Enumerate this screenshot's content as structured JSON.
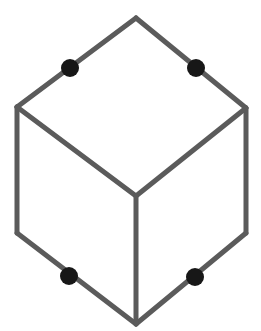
{
  "figure": {
    "type": "line-drawing",
    "canvas": {
      "width": 261,
      "height": 331,
      "background_color": "#ffffff"
    },
    "style": {
      "edge_color": "#5b5b5b",
      "edge_width": 5,
      "dot_color": "#171717",
      "dot_radius": 9
    },
    "vertices": {
      "top": {
        "label": "top-apex",
        "x": 136,
        "y": 18
      },
      "upper_left": {
        "label": "upper-left-corner",
        "x": 17,
        "y": 107
      },
      "upper_right": {
        "label": "upper-right-corner",
        "x": 246,
        "y": 108
      },
      "lower_left": {
        "label": "lower-left-corner",
        "x": 17,
        "y": 233
      },
      "lower_right": {
        "label": "lower-right-corner",
        "x": 246,
        "y": 233
      },
      "bottom": {
        "label": "bottom-apex",
        "x": 136,
        "y": 324
      },
      "center": {
        "label": "center-junction",
        "x": 136,
        "y": 196
      }
    },
    "edges": [
      {
        "name": "top-left-outer-edge",
        "from": "upper_left",
        "to": "top",
        "path": "M 17 107 L 136 18"
      },
      {
        "name": "top-right-outer-edge",
        "from": "top",
        "to": "upper_right",
        "path": "M 136 18 L 246 108"
      },
      {
        "name": "left-vertical-edge",
        "from": "upper_left",
        "to": "lower_left",
        "path": "M 17 107 L 17 233"
      },
      {
        "name": "right-vertical-edge",
        "from": "upper_right",
        "to": "lower_right",
        "path": "M 246 108 L 246 233"
      },
      {
        "name": "bottom-left-outer-edge",
        "from": "lower_left",
        "to": "bottom",
        "path": "M 17 233 L 136 324"
      },
      {
        "name": "bottom-right-outer-edge",
        "from": "bottom",
        "to": "lower_right",
        "path": "M 136 324 L 246 233"
      },
      {
        "name": "inner-left-edge",
        "from": "upper_left",
        "to": "center",
        "path": "M 17 107 L 136 196"
      },
      {
        "name": "inner-right-edge",
        "from": "upper_right",
        "to": "center",
        "path": "M 246 108 L 136 196"
      },
      {
        "name": "inner-vertical-edge",
        "from": "center",
        "to": "bottom",
        "path": "M 136 196 L 136 324"
      }
    ],
    "dots": [
      {
        "name": "dot-top-left",
        "x": 70,
        "y": 68,
        "r": 9,
        "on_edge": "top-left-outer-edge"
      },
      {
        "name": "dot-top-right",
        "x": 196,
        "y": 68,
        "r": 9,
        "on_edge": "top-right-outer-edge"
      },
      {
        "name": "dot-bottom-left",
        "x": 69,
        "y": 276,
        "r": 9,
        "on_edge": "bottom-left-outer-edge"
      },
      {
        "name": "dot-bottom-right",
        "x": 195,
        "y": 277,
        "r": 9,
        "on_edge": "bottom-right-outer-edge"
      }
    ]
  }
}
